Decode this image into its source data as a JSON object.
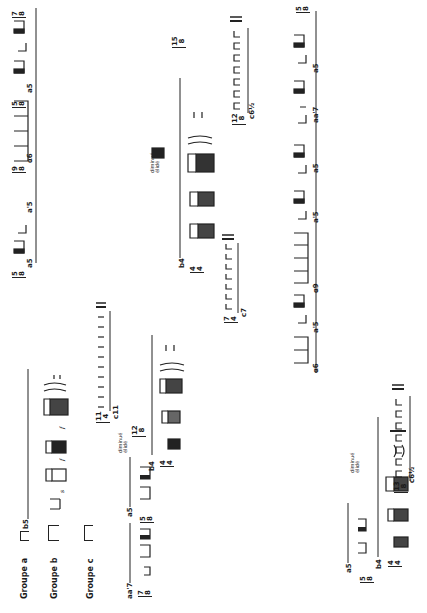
{
  "groups": {
    "a": {
      "label": "Groupe a",
      "greek": "α"
    },
    "b": {
      "label": "Groupe b"
    },
    "c": {
      "label": "Groupe c"
    }
  },
  "row_a_top": {
    "items": [
      {
        "label": "a5",
        "time": [
          "7",
          "8"
        ]
      },
      {
        "label": "α6",
        "time": [
          "5",
          "8"
        ]
      },
      {
        "label": "a'5",
        "time": [
          "9",
          "8"
        ]
      },
      {
        "label": "a5",
        "time": [
          "5",
          "8"
        ]
      }
    ]
  },
  "row_a_bottom": {
    "items": [
      {
        "label": "a5",
        "time": [
          "5",
          "8"
        ]
      },
      {
        "label": "aa'7",
        "time": [
          "7",
          "8"
        ]
      },
      {
        "label": "a5",
        "time": [
          "5",
          "8"
        ]
      }
    ]
  },
  "row_a_right": {
    "items": [
      {
        "label": "a5",
        "time": [
          "5",
          "8"
        ]
      },
      {
        "label": "aa'7",
        "time": [
          "7",
          "8"
        ]
      },
      {
        "label": "a5",
        "time": [
          "5",
          "8"
        ]
      },
      {
        "label": "a'5",
        "time": [
          "5",
          "8"
        ]
      },
      {
        "label": "α9",
        "time": [
          "9",
          "8"
        ]
      },
      {
        "label": "a'5",
        "time": [
          "5",
          "8"
        ]
      },
      {
        "label": "α6",
        "time": [
          "6",
          "8"
        ]
      }
    ]
  },
  "b_rows": [
    {
      "label": "b5",
      "time": [
        "5",
        "4"
      ]
    },
    {
      "label": "b4",
      "time": [
        "4",
        "4"
      ]
    },
    {
      "label": "b4",
      "time": [
        "4",
        "4"
      ]
    },
    {
      "label": "b4",
      "time": [
        "4",
        "4"
      ]
    }
  ],
  "diminue": {
    "line1": "diminué",
    "line2": "élidé",
    "prefix": "a",
    "time": [
      "12",
      "8"
    ]
  },
  "c_rows": [
    {
      "label": "c11",
      "time": [
        "11",
        "4"
      ]
    },
    {
      "label": "c7",
      "time": [
        "7",
        "4"
      ]
    },
    {
      "label": "c6½",
      "time": [
        "12",
        "8"
      ]
    },
    {
      "label": "c6½",
      "time": [
        "13",
        "8"
      ]
    }
  ],
  "dynamics": {
    "s": "s",
    "f": "f",
    "rest": "7"
  },
  "lone_time": [
    "15",
    "8"
  ]
}
